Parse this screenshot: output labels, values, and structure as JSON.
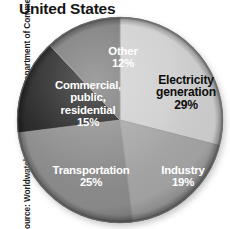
{
  "title": "United States",
  "source_credit": "Source: Worldwatch Institute and U.S. Department of Commerce",
  "chart_data": {
    "type": "pie",
    "title": "United States",
    "xlabel": "",
    "ylabel": "",
    "unit": "%",
    "legend": "none (labels drawn inside slices)",
    "grid": false,
    "start_angle_deg": 0,
    "direction": "clockwise",
    "categories": [
      "Electricity generation",
      "Industry",
      "Transportation",
      "Commercial, public, residential",
      "Other"
    ],
    "values": [
      29,
      19,
      25,
      15,
      12
    ],
    "slices": [
      {
        "label": "Electricity generation",
        "label_line1": "Electricity",
        "label_line2": "generation",
        "value": 29,
        "value_text": "29%",
        "color": "#cfcfcf",
        "text_color": "#0d0d0d",
        "start_deg": 0,
        "end_deg": 104.4
      },
      {
        "label": "Industry",
        "label_line1": "Industry",
        "label_line2": "",
        "value": 19,
        "value_text": "19%",
        "color": "#a5a5a5",
        "text_color": "#ffffff",
        "start_deg": 104.4,
        "end_deg": 172.8
      },
      {
        "label": "Transportation",
        "label_line1": "Transportation",
        "label_line2": "",
        "value": 25,
        "value_text": "25%",
        "color": "#8c8c8c",
        "text_color": "#ffffff",
        "start_deg": 172.8,
        "end_deg": 262.8
      },
      {
        "label": "Commercial, public, residential",
        "label_line1": "Commercial,",
        "label_line2": "public,",
        "label_line3": "residential",
        "value": 15,
        "value_text": "15%",
        "color": "#1e1e1e",
        "text_color": "#ffffff",
        "start_deg": 262.8,
        "end_deg": 316.8
      },
      {
        "label": "Other",
        "label_line1": "Other",
        "label_line2": "",
        "value": 12,
        "value_text": "12%",
        "color": "#757575",
        "text_color": "#ffffff",
        "start_deg": 316.8,
        "end_deg": 360
      }
    ]
  },
  "colors": {
    "background": "#ffffff",
    "title_text": "#161616",
    "source_text": "#1d1d1d",
    "slice_electricity": "#cfcfcf",
    "slice_industry": "#a5a5a5",
    "slice_transportation": "#8c8c8c",
    "slice_commercial": "#1e1e1e",
    "slice_other": "#757575",
    "shadow": "#b9b9b9"
  }
}
